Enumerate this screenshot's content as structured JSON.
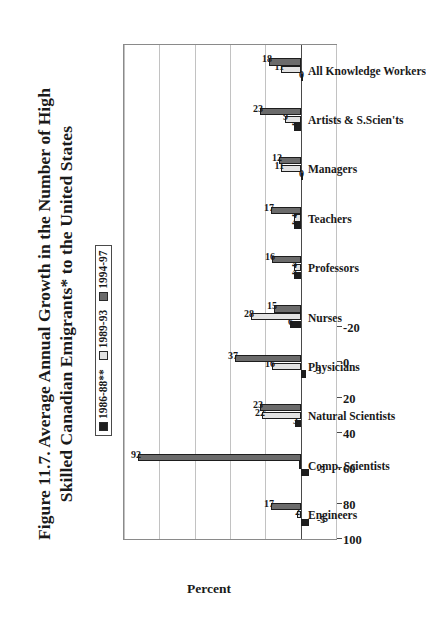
{
  "figure": {
    "title": "Figure 11.7. Average Annual Growth in the Number of High Skilled Canadian Emigrants* to the United States",
    "title_line1": "Figure 11.7. Average Annual Growth in the Number of High",
    "title_line2": "Skilled Canadian Emigrants* to the United States"
  },
  "legend": {
    "position": "top-left-inside",
    "items": [
      {
        "label": "1986-88**",
        "color": "#1d1d1d"
      },
      {
        "label": "1989-93",
        "color": "#e2e2e2"
      },
      {
        "label": "1994-97",
        "color": "#6b6b6b"
      }
    ]
  },
  "chart_data": {
    "type": "bar",
    "orientation": "vertical",
    "title": "Figure 11.7. Average Annual Growth in the Number of High Skilled Canadian Emigrants* to the United States",
    "subtitle": "",
    "xlabel": "",
    "ylabel": "Percent",
    "ylim": [
      -20,
      100
    ],
    "yticks": [
      -20,
      0,
      20,
      40,
      60,
      80,
      100
    ],
    "ytick_labels": [
      "-20",
      "0",
      "20",
      "40",
      "60",
      "80",
      "100"
    ],
    "grid": true,
    "legend_position": "upper-left",
    "categories": [
      "Engineers",
      "Comp. Scientists",
      "Natural Scientists",
      "Physicians",
      "Nurses",
      "Professors",
      "Teachers",
      "Managers",
      "Artists & S.Scien'ts",
      "All Knowledge Workers"
    ],
    "series": [
      {
        "name": "1986-88**",
        "color": "#1d1d1d",
        "values": [
          -5,
          -5,
          3,
          -3,
          6,
          4,
          4,
          0,
          4,
          0
        ],
        "labels": [
          "-5",
          "-5",
          "3",
          "-3",
          "6",
          "4",
          "4",
          "0",
          "4",
          "0"
        ]
      },
      {
        "name": "1989-93",
        "color": "#e2e2e2",
        "values": [
          2,
          1,
          22,
          16,
          28,
          4,
          4,
          11,
          9,
          11
        ],
        "labels": [
          "2",
          "",
          "22",
          "16",
          "28",
          "4",
          "4",
          "11",
          "9",
          "11"
        ]
      },
      {
        "name": "1994-97",
        "color": "#6b6b6b",
        "values": [
          17,
          92,
          23,
          37,
          15,
          16,
          17,
          12,
          23,
          18
        ],
        "labels": [
          "17",
          "92",
          "23",
          "37",
          "15",
          "16",
          "17",
          "12",
          "23",
          "18"
        ]
      }
    ]
  }
}
